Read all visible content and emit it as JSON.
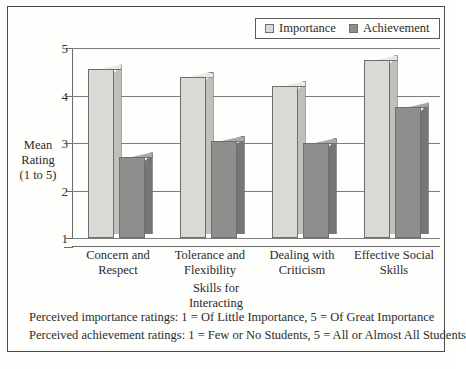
{
  "chart_data": {
    "type": "bar",
    "title": "",
    "categories": [
      "Concern and Respect",
      "Tolerance and Flexibility",
      "Dealing with Criticism",
      "Effective Social Skills"
    ],
    "category_lines": [
      [
        "Concern and",
        "Respect"
      ],
      [
        "Tolerance and",
        "Flexibility"
      ],
      [
        "Dealing with",
        "Criticism"
      ],
      [
        "Effective Social",
        "Skills"
      ]
    ],
    "series": [
      {
        "name": "Importance",
        "values": [
          4.55,
          4.4,
          4.2,
          4.75
        ],
        "color": "#d9d9d5"
      },
      {
        "name": "Achievement",
        "values": [
          2.7,
          3.05,
          3.0,
          3.75
        ],
        "color": "#8e8e8c"
      }
    ],
    "xlabel": "Skills for Interacting",
    "xlabel_lines": [
      "Skills for",
      "Interacting"
    ],
    "ylabel": "Mean Rating (1 to 5)",
    "ylabel_lines": [
      "Mean",
      "Rating",
      "(1 to 5)"
    ],
    "ylim": [
      1,
      5
    ],
    "yticks": [
      1,
      2,
      3,
      4,
      5
    ],
    "ytick_labels": [
      "1",
      "2",
      "3",
      "4",
      "5"
    ],
    "grid": true,
    "legend_position": "top-right"
  },
  "legend": {
    "entries": [
      {
        "label": "Importance",
        "swatch": "light-gray-swatch-icon"
      },
      {
        "label": "Achievement",
        "swatch": "dark-gray-swatch-icon"
      }
    ]
  },
  "footnotes": [
    "Perceived importance ratings: 1 = Of Little Importance, 5 = Of Great Importance",
    "Perceived achievement ratings: 1 = Few or No Students, 5 = All or Almost All Students"
  ]
}
